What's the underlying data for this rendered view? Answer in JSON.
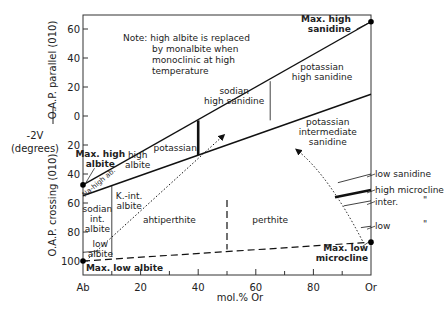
{
  "chart_data": {
    "type": "diagram",
    "title": "",
    "xlabel": "mol.% Or",
    "ylabel_main": "-2V",
    "ylabel_unit": "(degrees)",
    "ylabel_upper": "O.A.P. parallel (010)",
    "ylabel_lower": "O.A.P. crossing (010)",
    "x_ticks": [
      {
        "value": 0,
        "label": "Ab"
      },
      {
        "value": 20,
        "label": "20"
      },
      {
        "value": 40,
        "label": "40"
      },
      {
        "value": 60,
        "label": "60"
      },
      {
        "value": 80,
        "label": "80"
      },
      {
        "value": 100,
        "label": "Or"
      }
    ],
    "x_minor_ticks": [
      10,
      30,
      50,
      70,
      90
    ],
    "y_ticks": [
      {
        "value": 60,
        "label": "60"
      },
      {
        "value": 40,
        "label": "40"
      },
      {
        "value": 20,
        "label": "20"
      },
      {
        "value": 0,
        "label": "0"
      },
      {
        "value": -20,
        "label": "20"
      },
      {
        "value": -40,
        "label": "40"
      },
      {
        "value": -60,
        "label": "60"
      },
      {
        "value": -80,
        "label": "80"
      },
      {
        "value": -100,
        "label": "100"
      }
    ],
    "xlim": [
      0,
      100
    ],
    "ylim": [
      -108,
      70
    ],
    "y_convention": "positive = O.A.P. parallel (010); negative = O.A.P. crossing (010)",
    "note": [
      "Note: high albite is replaced",
      "by monalbite when",
      "monoclinic at high",
      "temperature"
    ],
    "lines": [
      {
        "name": "high-series-upper-line",
        "style": "solid",
        "points": [
          [
            0,
            -47.5
          ],
          [
            100,
            65
          ]
        ]
      },
      {
        "name": "high-series-lower-line",
        "style": "solid",
        "points": [
          [
            0,
            -55
          ],
          [
            100,
            15
          ]
        ]
      },
      {
        "name": "potassian-boundary-line",
        "style": "thick",
        "points": [
          [
            40,
            -3
          ],
          [
            40,
            -27
          ]
        ]
      },
      {
        "name": "sanidine-divide-line",
        "style": "thin",
        "points": [
          [
            65,
            24
          ],
          [
            65,
            -3
          ]
        ]
      },
      {
        "name": "albite-divide-line",
        "style": "thin",
        "points": [
          [
            10,
            -48
          ],
          [
            10,
            -97
          ]
        ]
      },
      {
        "name": "perthite-divide-line",
        "style": "dashed",
        "points": [
          [
            50,
            -58
          ],
          [
            50,
            -92
          ]
        ]
      },
      {
        "name": "low-series-line",
        "style": "dashed",
        "points": [
          [
            0,
            -100
          ],
          [
            100,
            -87
          ]
        ]
      },
      {
        "name": "low-sanidine-line",
        "style": "thin",
        "points": [
          [
            88.5,
            -46
          ],
          [
            100,
            -40
          ]
        ]
      },
      {
        "name": "high-microcline-line",
        "style": "thick",
        "points": [
          [
            87.5,
            -56
          ],
          [
            100,
            -51
          ]
        ]
      },
      {
        "name": "inter-microcline-line",
        "style": "thin",
        "points": [
          [
            90.5,
            -62
          ],
          [
            100,
            -58.5
          ]
        ]
      },
      {
        "name": "low-microcline-line",
        "style": "thin",
        "points": [
          [
            96.5,
            -77
          ],
          [
            100,
            -76
          ]
        ]
      },
      {
        "name": "low-albite-line",
        "style": "thin",
        "points": [
          [
            0,
            -94
          ],
          [
            6,
            -93
          ]
        ]
      }
    ],
    "arrows": [
      {
        "name": "albite-arrow",
        "style": "dotted",
        "from": [
          2,
          -98
        ],
        "to": [
          49,
          -13
        ]
      },
      {
        "name": "microcline-arrow",
        "style": "dotted",
        "from": [
          97,
          -86
        ],
        "via": [
          85,
          -40
        ],
        "to": [
          74,
          -23
        ]
      }
    ],
    "points": [
      {
        "name": "max-high-albite-point",
        "x": 0,
        "y": -47.5
      },
      {
        "name": "max-high-sanidine-point",
        "x": 100,
        "y": 65
      },
      {
        "name": "max-low-albite-point",
        "x": 0,
        "y": -100
      },
      {
        "name": "max-low-microcline-point",
        "x": 100,
        "y": -87
      }
    ],
    "region_labels": [
      {
        "name": "max-high-sanidine-label",
        "lines": [
          "Max. high",
          "sanidine"
        ],
        "x": 93,
        "y": 65,
        "anchor": "end",
        "bold": true
      },
      {
        "name": "potassian-high-sanidine-label",
        "lines": [
          "potassian",
          "high sanidine"
        ],
        "x": 83,
        "y": 32,
        "anchor": "middle"
      },
      {
        "name": "sodian-high-sanidine-label",
        "lines": [
          "sodian",
          "high sanidine"
        ],
        "x": 52.5,
        "y": 15,
        "anchor": "middle"
      },
      {
        "name": "potassian-intermediate-sanidine-label",
        "lines": [
          "potassian",
          "intermediate",
          "sanidine"
        ],
        "x": 85,
        "y": -6,
        "anchor": "middle"
      },
      {
        "name": "potassian-label",
        "lines": [
          "potassian"
        ],
        "x": 32,
        "y": -24,
        "anchor": "middle"
      },
      {
        "name": "high-albite-label",
        "lines": [
          "high",
          "albite"
        ],
        "x": 19,
        "y": -29,
        "anchor": "middle"
      },
      {
        "name": "max-high-albite-label",
        "lines": [
          "Max. high",
          "albite"
        ],
        "x": 6,
        "y": -28,
        "anchor": "middle",
        "bold": true
      },
      {
        "name": "k-int-albite-label",
        "lines": [
          "K.-int.",
          "albite"
        ],
        "x": 16,
        "y": -57,
        "anchor": "middle"
      },
      {
        "name": "sodian-int-albite-label",
        "lines": [
          "sodian",
          "int.",
          "albite"
        ],
        "x": 5,
        "y": -66,
        "anchor": "middle"
      },
      {
        "name": "antiperthite-label",
        "lines": [
          "ahtiperthite"
        ],
        "x": 30,
        "y": -74,
        "anchor": "middle"
      },
      {
        "name": "perthite-label",
        "lines": [
          "perthite"
        ],
        "x": 65,
        "y": -74,
        "anchor": "middle"
      },
      {
        "name": "low-albite-label",
        "lines": [
          "low",
          "albite"
        ],
        "x": 6,
        "y": -90,
        "anchor": "middle"
      },
      {
        "name": "max-low-albite-label",
        "lines": [
          "Max. low albite"
        ],
        "x": 1,
        "y": -107,
        "anchor": "start",
        "bold": true
      },
      {
        "name": "max-low-microcline-label",
        "lines": [
          "Max. low",
          "microcline"
        ],
        "x": 99,
        "y": -93,
        "anchor": "end",
        "bold": true
      }
    ],
    "rotated_label": {
      "name": "na-high-ab-label",
      "text": "Na-high ab.",
      "x": 6,
      "y": -47
    },
    "side_labels": [
      {
        "name": "low-sanidine-label",
        "text": "low sanidine",
        "ditto": "",
        "y": -40
      },
      {
        "name": "high-microcline-label",
        "text": "high microcline",
        "ditto": "",
        "y": -51
      },
      {
        "name": "inter-microcline-label",
        "text": "inter.",
        "ditto": "\"",
        "y": -59
      },
      {
        "name": "low-microcline-label",
        "text": "low",
        "ditto": "\"",
        "y": -76
      }
    ]
  }
}
